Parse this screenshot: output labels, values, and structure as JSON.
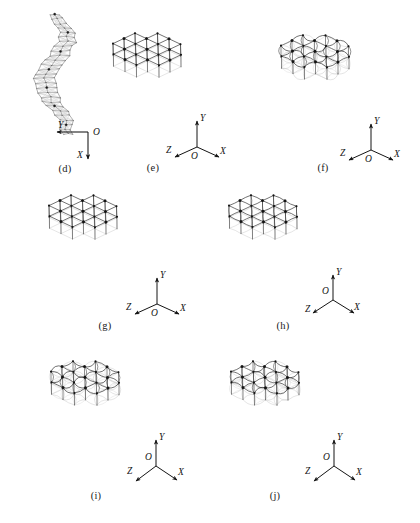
{
  "figure": {
    "background_color": "#ffffff",
    "line_color": "#2b2b2b",
    "ghost_color": "#b9b9b9",
    "node_color": "#111111",
    "panel_count": 7
  },
  "panels": [
    {
      "id": "d",
      "caption": "(d)",
      "view": "edge-on",
      "structure": "twisted-bundle",
      "members": "straight",
      "axes": {
        "type": "2d",
        "origin_label": "O",
        "labels": [
          "Y",
          "X"
        ],
        "y_label": "Y",
        "x_label": "X",
        "z_label": "",
        "y_direction": "left",
        "x_direction": "down"
      }
    },
    {
      "id": "e",
      "caption": "(e)",
      "view": "isometric",
      "structure": "triangulated-lattice",
      "members": "straight",
      "axes": {
        "type": "3d",
        "origin_label": "O",
        "labels": [
          "Y",
          "Z",
          "X"
        ],
        "y_label": "Y",
        "x_label": "X",
        "z_label": "Z",
        "y_direction": "up",
        "x_direction": "down-right",
        "z_direction": "down-left"
      }
    },
    {
      "id": "f",
      "caption": "(f)",
      "view": "isometric",
      "structure": "triangulated-lattice",
      "members": "buckled-curved",
      "axes": {
        "type": "3d",
        "origin_label": "O",
        "labels": [
          "Y",
          "Z",
          "X"
        ],
        "y_label": "Y",
        "x_label": "X",
        "z_label": "Z",
        "y_direction": "up",
        "x_direction": "down-right",
        "z_direction": "down-left"
      }
    },
    {
      "id": "g",
      "caption": "(g)",
      "view": "isometric",
      "structure": "triangulated-lattice",
      "members": "straight",
      "axes": {
        "type": "3d",
        "origin_label": "O",
        "labels": [
          "Y",
          "Z",
          "X"
        ],
        "y_label": "Y",
        "x_label": "X",
        "z_label": "Z",
        "y_direction": "up",
        "x_direction": "down-right",
        "z_direction": "down-left"
      }
    },
    {
      "id": "h",
      "caption": "(h)",
      "view": "isometric",
      "structure": "triangulated-lattice",
      "members": "mildly-curved",
      "axes": {
        "type": "3d",
        "origin_label": "O",
        "labels": [
          "Y",
          "Z",
          "X"
        ],
        "y_label": "Y",
        "x_label": "X",
        "z_label": "Z",
        "y_direction": "up",
        "x_direction": "down-right",
        "z_direction": "down-left"
      }
    },
    {
      "id": "i",
      "caption": "(i)",
      "view": "isometric",
      "structure": "triangulated-lattice",
      "members": "buckled-curved",
      "axes": {
        "type": "3d",
        "origin_label": "O",
        "labels": [
          "Y",
          "Z",
          "X"
        ],
        "y_label": "Y",
        "x_label": "X",
        "z_label": "Z",
        "y_direction": "up",
        "x_direction": "down-right",
        "z_direction": "down-left"
      }
    },
    {
      "id": "j",
      "caption": "(j)",
      "view": "isometric",
      "structure": "triangulated-lattice",
      "members": "buckled-curved",
      "axes": {
        "type": "3d",
        "origin_label": "O",
        "labels": [
          "Y",
          "Z",
          "X"
        ],
        "y_label": "Y",
        "x_label": "X",
        "z_label": "Z",
        "y_direction": "up",
        "x_direction": "down-right",
        "z_direction": "down-left"
      }
    }
  ]
}
